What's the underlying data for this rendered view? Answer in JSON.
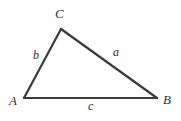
{
  "figure": {
    "type": "geometry-diagram",
    "shape": "triangle",
    "background_color": "#ffffff",
    "stroke_color": "#3a3a3a",
    "stroke_width": 2,
    "label_color": "#2e2e2e"
  },
  "vertices": {
    "A": {
      "label": "A",
      "x": 24,
      "y": 98
    },
    "B": {
      "label": "B",
      "x": 157,
      "y": 98
    },
    "C": {
      "label": "C",
      "x": 61,
      "y": 29
    }
  },
  "sides": {
    "a": {
      "label": "a",
      "from": "B",
      "to": "C"
    },
    "b": {
      "label": "b",
      "from": "A",
      "to": "C"
    },
    "c": {
      "label": "c",
      "from": "A",
      "to": "B"
    }
  },
  "chart_data": {
    "type": "scatter",
    "title": "",
    "xlabel": "",
    "ylabel": "",
    "points": [
      {
        "name": "A",
        "x": 24,
        "y": 98
      },
      {
        "name": "C",
        "x": 61,
        "y": 29
      },
      {
        "name": "B",
        "x": 157,
        "y": 98
      }
    ],
    "edges": [
      {
        "name": "b",
        "from": "A",
        "to": "C"
      },
      {
        "name": "a",
        "from": "C",
        "to": "B"
      },
      {
        "name": "c",
        "from": "A",
        "to": "B"
      }
    ],
    "annotations": [
      "A",
      "B",
      "C",
      "a",
      "b",
      "c"
    ],
    "grid": false,
    "legend": "none"
  }
}
